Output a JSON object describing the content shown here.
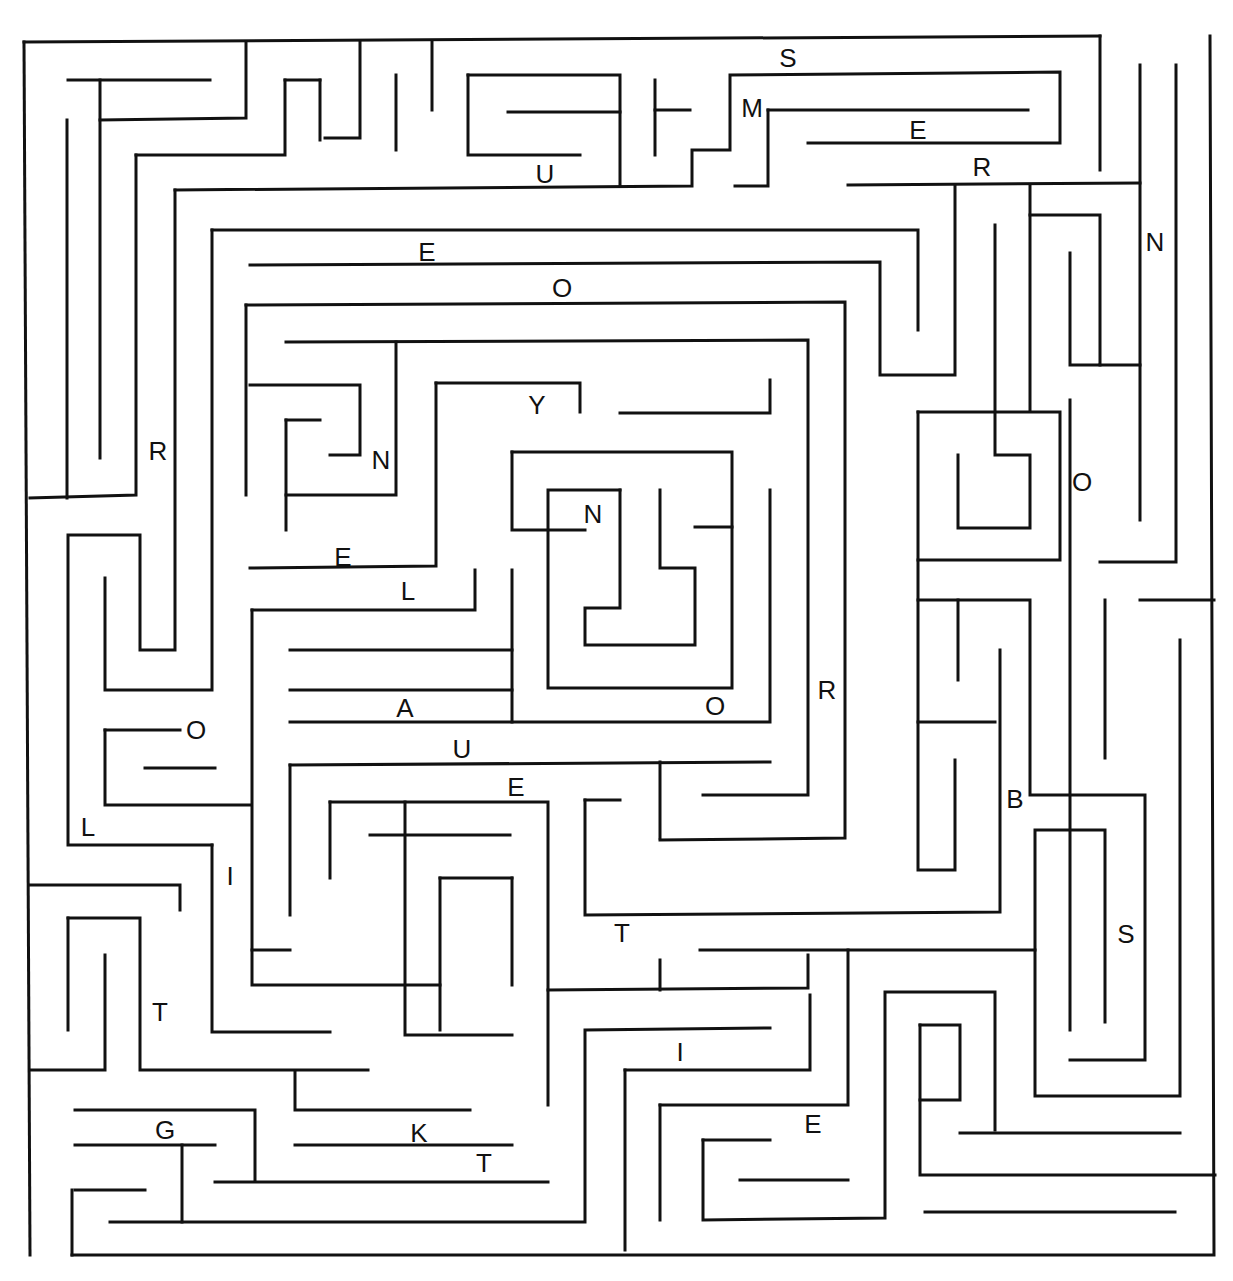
{
  "puzzle": {
    "type": "letter maze"
  },
  "letters": [
    {
      "char": "S",
      "x": 788,
      "y": 58
    },
    {
      "char": "M",
      "x": 752,
      "y": 108
    },
    {
      "char": "E",
      "x": 918,
      "y": 130
    },
    {
      "char": "R",
      "x": 982,
      "y": 167
    },
    {
      "char": "U",
      "x": 545,
      "y": 174
    },
    {
      "char": "N",
      "x": 1155,
      "y": 242
    },
    {
      "char": "E",
      "x": 427,
      "y": 252
    },
    {
      "char": "O",
      "x": 562,
      "y": 288
    },
    {
      "char": "Y",
      "x": 537,
      "y": 405
    },
    {
      "char": "R",
      "x": 158,
      "y": 451
    },
    {
      "char": "N",
      "x": 381,
      "y": 460
    },
    {
      "char": "O",
      "x": 1082,
      "y": 482
    },
    {
      "char": "N",
      "x": 593,
      "y": 514
    },
    {
      "char": "E",
      "x": 343,
      "y": 557
    },
    {
      "char": "L",
      "x": 408,
      "y": 591
    },
    {
      "char": "R",
      "x": 827,
      "y": 690
    },
    {
      "char": "A",
      "x": 405,
      "y": 708
    },
    {
      "char": "O",
      "x": 715,
      "y": 706
    },
    {
      "char": "O",
      "x": 196,
      "y": 730
    },
    {
      "char": "U",
      "x": 462,
      "y": 749
    },
    {
      "char": "E",
      "x": 516,
      "y": 787
    },
    {
      "char": "B",
      "x": 1015,
      "y": 799
    },
    {
      "char": "L",
      "x": 88,
      "y": 827
    },
    {
      "char": "I",
      "x": 230,
      "y": 876
    },
    {
      "char": "S",
      "x": 1126,
      "y": 934
    },
    {
      "char": "T",
      "x": 622,
      "y": 933
    },
    {
      "char": "T",
      "x": 160,
      "y": 1012
    },
    {
      "char": "I",
      "x": 680,
      "y": 1052
    },
    {
      "char": "E",
      "x": 813,
      "y": 1124
    },
    {
      "char": "G",
      "x": 165,
      "y": 1130
    },
    {
      "char": "K",
      "x": 419,
      "y": 1133
    },
    {
      "char": "T",
      "x": 484,
      "y": 1163
    }
  ],
  "colors": {
    "wall": "#111111",
    "background": "#ffffff"
  }
}
